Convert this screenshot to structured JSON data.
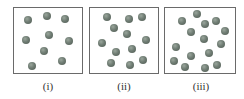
{
  "figure": {
    "panels": [
      {
        "label": "(i)",
        "box": {
          "left": 13,
          "top": 7,
          "width": 70,
          "height": 67
        },
        "label_center_x": 48,
        "ball_count": 9,
        "balls": [
          [
            28,
            20
          ],
          [
            47,
            16
          ],
          [
            65,
            19
          ],
          [
            26,
            40
          ],
          [
            49,
            35
          ],
          [
            69,
            41
          ],
          [
            44,
            51
          ],
          [
            62,
            61
          ],
          [
            32,
            66
          ]
        ]
      },
      {
        "label": "(ii)",
        "box": {
          "left": 89,
          "top": 7,
          "width": 70,
          "height": 67
        },
        "label_center_x": 124,
        "ball_count": 12,
        "balls": [
          [
            107,
            17
          ],
          [
            129,
            19
          ],
          [
            142,
            17
          ],
          [
            114,
            28
          ],
          [
            127,
            34
          ],
          [
            146,
            40
          ],
          [
            102,
            43
          ],
          [
            116,
            52
          ],
          [
            132,
            49
          ],
          [
            111,
            63
          ],
          [
            130,
            65
          ],
          [
            143,
            60
          ]
        ]
      },
      {
        "label": "(iii)",
        "box": {
          "left": 164,
          "top": 7,
          "width": 72,
          "height": 67
        },
        "label_center_x": 201,
        "ball_count": 15,
        "balls": [
          [
            197,
            14
          ],
          [
            182,
            21
          ],
          [
            205,
            24
          ],
          [
            216,
            21
          ],
          [
            191,
            32
          ],
          [
            225,
            31
          ],
          [
            204,
            39
          ],
          [
            176,
            47
          ],
          [
            221,
            44
          ],
          [
            191,
            56
          ],
          [
            209,
            53
          ],
          [
            174,
            61
          ],
          [
            185,
            67
          ],
          [
            205,
            68
          ],
          [
            217,
            65
          ]
        ]
      }
    ]
  }
}
